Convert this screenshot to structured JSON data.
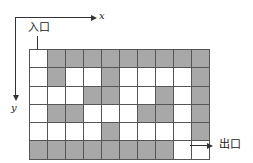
{
  "axes": {
    "x_label": "x",
    "y_label": "y"
  },
  "labels": {
    "entrance": "入口",
    "exit": "出口"
  },
  "colors": {
    "wall": "#a8a8a8",
    "path": "#ffffff",
    "grid_line": "#555555"
  },
  "maze": {
    "rows": 6,
    "cols": 10,
    "grid": [
      [
        0,
        1,
        1,
        1,
        1,
        1,
        1,
        1,
        1,
        1
      ],
      [
        0,
        1,
        0,
        0,
        1,
        0,
        0,
        0,
        0,
        1
      ],
      [
        0,
        0,
        0,
        1,
        1,
        0,
        0,
        1,
        0,
        1
      ],
      [
        0,
        1,
        1,
        0,
        0,
        0,
        1,
        1,
        0,
        1
      ],
      [
        0,
        0,
        0,
        0,
        1,
        0,
        0,
        0,
        0,
        1
      ],
      [
        1,
        1,
        1,
        1,
        1,
        1,
        1,
        1,
        0,
        0
      ]
    ],
    "entrance_cell": [
      0,
      0
    ],
    "exit_cell": [
      5,
      9
    ]
  }
}
